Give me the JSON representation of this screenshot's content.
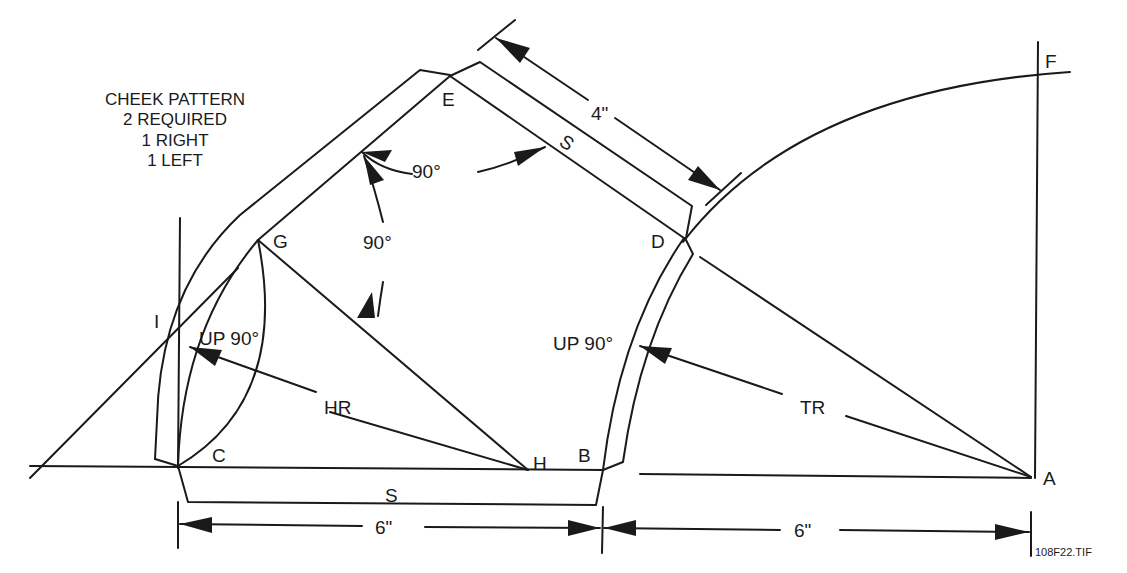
{
  "figure": {
    "title_block": {
      "line1": "CHEEK PATTERN",
      "line2": "2 REQUIRED",
      "line3": "1 RIGHT",
      "line4": "1 LEFT"
    },
    "points": {
      "A": "A",
      "B": "B",
      "C": "C",
      "D": "D",
      "E": "E",
      "F": "F",
      "G": "G",
      "H": "H",
      "I": "I"
    },
    "angles": {
      "top": "90°",
      "left": "90°"
    },
    "annotations": {
      "up_left": "UP 90°",
      "up_right": "UP 90°",
      "hr": "HR",
      "tr": "TR",
      "seam_top": "S",
      "seam_bottom": "S"
    },
    "dimensions": {
      "top": "4\"",
      "bottom_left": "6\"",
      "bottom_right": "6\""
    },
    "file_id": "108F22.TIF"
  },
  "colors": {
    "ink": "#1a1a1a",
    "paper": "#ffffff"
  }
}
